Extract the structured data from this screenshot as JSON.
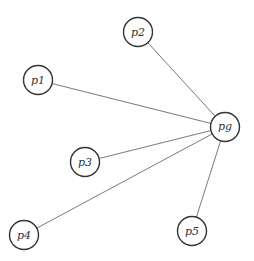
{
  "diagram": {
    "type": "star-graph",
    "nodes": [
      {
        "id": "p1",
        "label": "p1",
        "x": 38,
        "y": 80
      },
      {
        "id": "p2",
        "label": "p2",
        "x": 138,
        "y": 32
      },
      {
        "id": "pg",
        "label": "pg",
        "x": 225,
        "y": 127
      },
      {
        "id": "p3",
        "label": "p3",
        "x": 85,
        "y": 162
      },
      {
        "id": "p4",
        "label": "p4",
        "x": 24,
        "y": 235
      },
      {
        "id": "p5",
        "label": "p5",
        "x": 192,
        "y": 231
      }
    ],
    "edges": [
      {
        "from": "p1",
        "to": "pg"
      },
      {
        "from": "p2",
        "to": "pg"
      },
      {
        "from": "p3",
        "to": "pg"
      },
      {
        "from": "p4",
        "to": "pg"
      },
      {
        "from": "p5",
        "to": "pg"
      }
    ],
    "node_radius": 14.5
  }
}
